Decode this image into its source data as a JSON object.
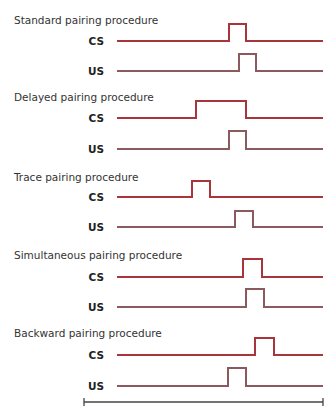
{
  "colors": {
    "cs": "#a8343c",
    "us": "#8a5a5e",
    "axis": "#444444",
    "text": "#333333"
  },
  "chart_data": {
    "type": "timing-diagram",
    "title": "",
    "x_axis": {
      "start": 84,
      "end": 323,
      "y": 402,
      "label": ""
    },
    "line_start": 117,
    "line_end": 323,
    "procedures": [
      {
        "title": "Standard pairing procedure",
        "title_y": 24,
        "signals": [
          {
            "label": "CS",
            "baseline": 41,
            "top": 24,
            "pulse_start": 229,
            "pulse_end": 246
          },
          {
            "label": "US",
            "baseline": 71,
            "top": 54,
            "pulse_start": 239,
            "pulse_end": 256
          }
        ]
      },
      {
        "title": "Delayed pairing procedure",
        "title_y": 101,
        "signals": [
          {
            "label": "CS",
            "baseline": 118,
            "top": 101,
            "pulse_start": 196,
            "pulse_end": 246
          },
          {
            "label": "US",
            "baseline": 149,
            "top": 131,
            "pulse_start": 229,
            "pulse_end": 246
          }
        ]
      },
      {
        "title": "Trace pairing procedure",
        "title_y": 181,
        "signals": [
          {
            "label": "CS",
            "baseline": 197,
            "top": 181,
            "pulse_start": 192,
            "pulse_end": 210
          },
          {
            "label": "US",
            "baseline": 227,
            "top": 211,
            "pulse_start": 235,
            "pulse_end": 253
          }
        ]
      },
      {
        "title": "Simultaneous pairing procedure",
        "title_y": 259,
        "signals": [
          {
            "label": "CS",
            "baseline": 277,
            "top": 259,
            "pulse_start": 243,
            "pulse_end": 262
          },
          {
            "label": "US",
            "baseline": 307,
            "top": 289,
            "pulse_start": 246,
            "pulse_end": 264
          }
        ]
      },
      {
        "title": "Backward pairing procedure",
        "title_y": 337,
        "signals": [
          {
            "label": "CS",
            "baseline": 355,
            "top": 338,
            "pulse_start": 255,
            "pulse_end": 274
          },
          {
            "label": "US",
            "baseline": 386,
            "top": 368,
            "pulse_start": 228,
            "pulse_end": 246
          }
        ]
      }
    ]
  }
}
